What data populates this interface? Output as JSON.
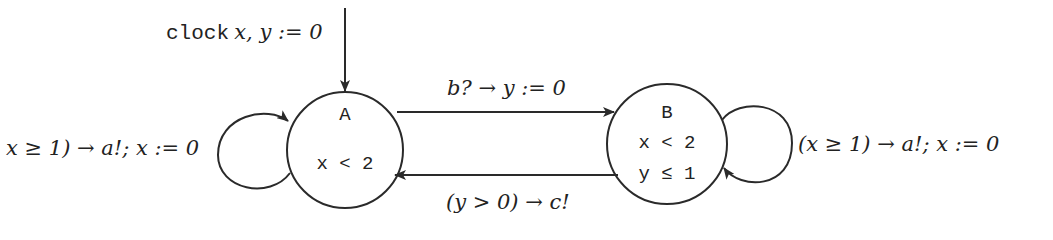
{
  "diagram": {
    "type": "timed-automaton",
    "colors": {
      "stroke": "#2a2a2a",
      "text": "#222222",
      "background": "#ffffff"
    },
    "initial": {
      "keyword": "clock",
      "declaration": "x, y := 0",
      "target": "A"
    },
    "states": [
      {
        "id": "A",
        "name": "A",
        "invariants": [
          "x < 2"
        ]
      },
      {
        "id": "B",
        "name": "B",
        "invariants": [
          "x < 2",
          "y ≤ 1"
        ]
      }
    ],
    "transitions": [
      {
        "from": "A",
        "to": "A",
        "label": "x ≥ 1) → a!; x := 0"
      },
      {
        "from": "A",
        "to": "B",
        "label": "b? → y := 0"
      },
      {
        "from": "B",
        "to": "A",
        "label": "(y > 0) → c!"
      },
      {
        "from": "B",
        "to": "B",
        "label": "(x ≥ 1) → a!; x := 0"
      }
    ]
  }
}
